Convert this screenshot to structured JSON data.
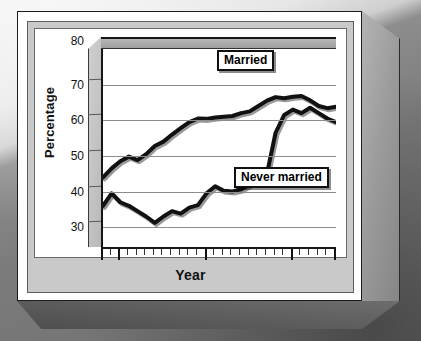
{
  "figure": {
    "ylabel": "Percentage",
    "xlabel": "Year"
  },
  "axis": {
    "y_ticks": [
      "80",
      "70",
      "60",
      "50",
      "40",
      "30"
    ],
    "x_ticks": [
      "1978",
      "1980",
      "1990",
      "2000",
      "2005"
    ]
  },
  "series_labels": {
    "married": "Married",
    "never_married": "Never married"
  },
  "chart_data": {
    "type": "line",
    "title": "",
    "xlabel": "Year",
    "ylabel": "Percentage",
    "xlim": [
      1978,
      2005
    ],
    "ylim": [
      25,
      80
    ],
    "grid": true,
    "grid_values": [
      30,
      40,
      50,
      60,
      70
    ],
    "legend_position": "inline-labels",
    "x": [
      1978,
      1979,
      1980,
      1981,
      1982,
      1983,
      1984,
      1985,
      1986,
      1987,
      1988,
      1989,
      1990,
      1991,
      1992,
      1993,
      1994,
      1995,
      1996,
      1997,
      1998,
      1999,
      2000,
      2001,
      2002,
      2003,
      2004,
      2005
    ],
    "series": [
      {
        "name": "Married",
        "values": [
          44.0,
          46.5,
          48.5,
          49.8,
          48.8,
          50.5,
          52.8,
          54.0,
          56.0,
          57.8,
          59.5,
          60.5,
          60.4,
          60.8,
          61.0,
          61.2,
          62.0,
          62.5,
          64.0,
          65.5,
          66.5,
          66.2,
          66.6,
          66.8,
          65.6,
          64.0,
          63.4,
          63.8
        ]
      },
      {
        "name": "Never married",
        "values": [
          36.0,
          39.5,
          37.0,
          36.0,
          34.5,
          33.0,
          31.2,
          33.0,
          34.5,
          33.8,
          35.5,
          36.2,
          39.5,
          41.5,
          40.2,
          40.0,
          40.6,
          42.0,
          44.6,
          45.0,
          56.5,
          61.5,
          63.0,
          62.0,
          63.5,
          62.0,
          60.5,
          59.5
        ]
      }
    ]
  }
}
